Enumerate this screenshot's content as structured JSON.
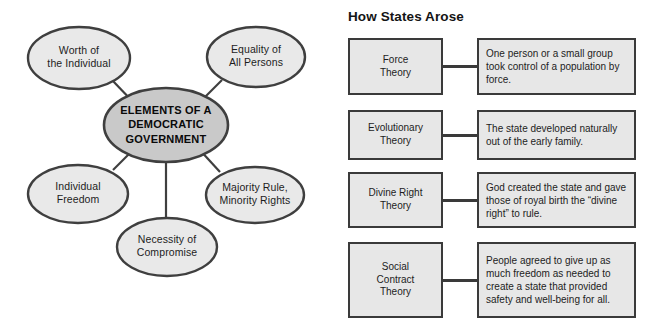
{
  "concept_map": {
    "center": {
      "label": "ELEMENTS OF A\nDEMOCRATIC\nGOVERNMENT",
      "fill": "#c9c9c9",
      "stroke": "#3f3f3f"
    },
    "nodes": [
      {
        "id": "worth-of-the-individual",
        "label": "Worth of\nthe Individual",
        "fill": "#e9e9e9",
        "stroke": "#3f3f3f"
      },
      {
        "id": "equality-of-all-persons",
        "label": "Equality of\nAll Persons",
        "fill": "#e9e9e9",
        "stroke": "#3f3f3f"
      },
      {
        "id": "individual-freedom",
        "label": "Individual\nFreedom",
        "fill": "#e9e9e9",
        "stroke": "#3f3f3f"
      },
      {
        "id": "majority-rule",
        "label": "Majority Rule,\nMinority Rights",
        "fill": "#e9e9e9",
        "stroke": "#3f3f3f"
      },
      {
        "id": "necessity-of-compromise",
        "label": "Necessity of\nCompromise",
        "fill": "#e9e9e9",
        "stroke": "#3f3f3f"
      }
    ]
  },
  "states_panel": {
    "heading": "How States Arose",
    "box_fill": "#e7e7e7",
    "box_stroke": "#3a3a3a",
    "rows": [
      {
        "theory": "Force\nTheory",
        "description": "One person or a small group took control of a population by force."
      },
      {
        "theory": "Evolutionary\nTheory",
        "description": "The state developed naturally out of the early family."
      },
      {
        "theory": "Divine Right\nTheory",
        "description": "God created the state and gave those of royal birth the “divine right” to rule."
      },
      {
        "theory": "Social\nContract\nTheory",
        "description": "People agreed to give up as much freedom as needed to create a state that provided safety and well-being for all."
      }
    ]
  }
}
